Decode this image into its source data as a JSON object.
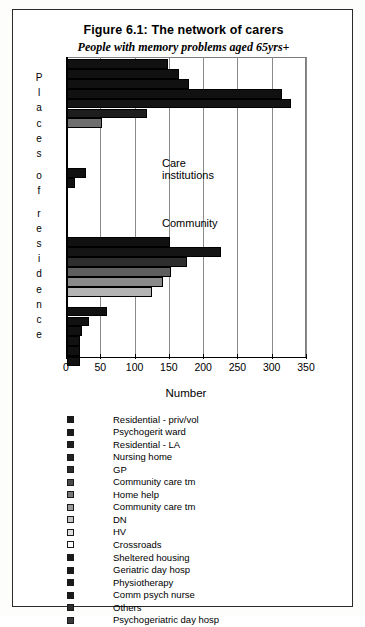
{
  "figure": {
    "title": "Figure 6.1: The network of carers",
    "subtitle": "People with memory problems aged 65yrs+"
  },
  "chart_data": {
    "type": "bar",
    "orientation": "horizontal",
    "title": "Figure 6.1: The network of carers",
    "subtitle": "People with memory problems aged 65yrs+",
    "xlabel": "Number",
    "ylabel": "Places of residence",
    "xlim": [
      0,
      350
    ],
    "xticks": [
      0,
      50,
      100,
      150,
      200,
      250,
      300,
      350
    ],
    "xtick_labels": [
      "0",
      "50",
      "100",
      "150",
      "200",
      "250",
      "300",
      "350"
    ],
    "grid": true,
    "grid_axis": "x",
    "legend_position": "below",
    "annotations": [
      {
        "text": "Care institutions",
        "x": 135,
        "y_group": "care-institutions"
      },
      {
        "text": "Community",
        "x": 135,
        "y_group": "community"
      }
    ],
    "categories": [
      "Residential - priv/vol",
      "Psychogerit ward",
      "Residential - LA",
      "Nursing home",
      "GP",
      "Community care tm",
      "Home help",
      "Community care tm",
      "DN",
      "HV",
      "Crossroads",
      "Sheltered housing",
      "Geriatric day hosp",
      "Physiotherapy",
      "Comm psych nurse",
      "Others",
      "Psychogeriatric day hosp"
    ],
    "groups": [
      {
        "name": "Care institutions",
        "bars": [
          {
            "series": "Residential - priv/vol",
            "value": 148,
            "color": "#111111"
          },
          {
            "series": "Psychogerit ward",
            "value": 163,
            "color": "#111111"
          },
          {
            "series": "Residential - LA",
            "value": 178,
            "color": "#111111"
          },
          {
            "series": "Nursing home",
            "value": 313,
            "color": "#111111"
          },
          {
            "series": "GP",
            "value": 327,
            "color": "#151515"
          },
          {
            "series": "Community care tm",
            "value": 117,
            "color": "#1d1d1d"
          },
          {
            "series": "Home help",
            "value": 51,
            "color": "#6e6e6e"
          },
          {
            "series": "Community care tm",
            "value": 0,
            "color": "#8c8c8c"
          },
          {
            "series": "DN",
            "value": 0,
            "color": "#a8a8a8"
          },
          {
            "series": "HV",
            "value": 0,
            "color": "#c8c8c8"
          },
          {
            "series": "Crossroads",
            "value": 0,
            "color": "#ffffff"
          },
          {
            "series": "Sheltered housing",
            "value": 28,
            "color": "#111111"
          },
          {
            "series": "Geriatric day hosp",
            "value": 12,
            "color": "#111111"
          },
          {
            "series": "Physiotherapy",
            "value": 0,
            "color": "#111111"
          },
          {
            "series": "Comm psych nurse",
            "value": 0,
            "color": "#111111"
          },
          {
            "series": "Others",
            "value": 0,
            "color": "#2a2a2a"
          },
          {
            "series": "Psychogeriatric day hosp",
            "value": 0,
            "color": "#3a3a3a"
          }
        ]
      },
      {
        "name": "Community",
        "bars": [
          {
            "series": "Residential - priv/vol",
            "value": 150,
            "color": "#111111"
          },
          {
            "series": "Psychogerit ward",
            "value": 224,
            "color": "#151515"
          },
          {
            "series": "Residential - LA",
            "value": 175,
            "color": "#2e2e2e"
          },
          {
            "series": "Nursing home",
            "value": 152,
            "color": "#5e5e5e"
          },
          {
            "series": "GP",
            "value": 140,
            "color": "#8a8a8a"
          },
          {
            "series": "Community care tm",
            "value": 124,
            "color": "#b4b4b4"
          },
          {
            "series": "Home help",
            "value": 0,
            "color": "#ffffff"
          },
          {
            "series": "Community care tm",
            "value": 58,
            "color": "#111111"
          },
          {
            "series": "DN",
            "value": 32,
            "color": "#111111"
          },
          {
            "series": "HV",
            "value": 22,
            "color": "#111111"
          },
          {
            "series": "Crossroads",
            "value": 19,
            "color": "#111111"
          },
          {
            "series": "Sheltered housing",
            "value": 19,
            "color": "#111111"
          },
          {
            "series": "Geriatric day hosp",
            "value": 19,
            "color": "#111111"
          }
        ]
      }
    ]
  },
  "axis": {
    "x_title": "Number",
    "y_title_letters": [
      "P",
      "l",
      "a",
      "c",
      "e",
      "s",
      "",
      "o",
      "f",
      "",
      "r",
      "e",
      "s",
      "i",
      "d",
      "e",
      "n",
      "c",
      "e"
    ],
    "tick_labels": [
      "0",
      "50",
      "100",
      "150",
      "200",
      "250",
      "300",
      "350"
    ]
  },
  "legend": {
    "items": [
      {
        "label": "Residential - priv/vol",
        "color": "#1a1a1a"
      },
      {
        "label": "Psychogerit ward",
        "color": "#1a1a1a"
      },
      {
        "label": "Residential - LA",
        "color": "#1f1f1f"
      },
      {
        "label": "Nursing home",
        "color": "#232323"
      },
      {
        "label": "GP",
        "color": "#2c2c2c"
      },
      {
        "label": "Community care tm",
        "color": "#4a4a4a"
      },
      {
        "label": "Home help",
        "color": "#777777"
      },
      {
        "label": "Community care tm",
        "color": "#9a9a9a"
      },
      {
        "label": "DN",
        "color": "#c4c4c4"
      },
      {
        "label": "HV",
        "color": "#dedede"
      },
      {
        "label": "Crossroads",
        "color": "#ffffff"
      },
      {
        "label": "Sheltered housing",
        "color": "#1a1a1a"
      },
      {
        "label": "Geriatric day hosp",
        "color": "#1a1a1a"
      },
      {
        "label": "Physiotherapy",
        "color": "#1a1a1a"
      },
      {
        "label": "Comm psych nurse",
        "color": "#1a1a1a"
      },
      {
        "label": "Others",
        "color": "#2e2e2e"
      },
      {
        "label": "Psychogeriatric day hosp",
        "color": "#3a3a3a"
      }
    ]
  }
}
